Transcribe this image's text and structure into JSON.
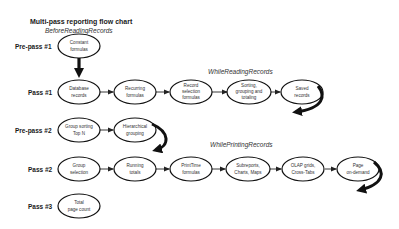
{
  "diagram": {
    "title": "Multi-pass reporting flow chart",
    "phases": [
      {
        "label": "BeforeReadingRecords"
      },
      {
        "label": "WhileReadingRecords"
      },
      {
        "label": "WhilePrintingRecords"
      }
    ],
    "rows": [
      {
        "label": "Pre-pass #1",
        "nodes": [
          {
            "lines": [
              "Constant",
              "formulas"
            ]
          }
        ]
      },
      {
        "label": "Pass #1",
        "nodes": [
          {
            "lines": [
              "Database",
              "records"
            ]
          },
          {
            "lines": [
              "Recurring",
              "formulas"
            ]
          },
          {
            "lines": [
              "Record",
              "selection",
              "formulas"
            ]
          },
          {
            "lines": [
              "Sorting,",
              "grouping and",
              "totaling"
            ]
          },
          {
            "lines": [
              "Saved",
              "records"
            ]
          }
        ]
      },
      {
        "label": "Pre-pass #2",
        "nodes": [
          {
            "lines": [
              "Group sorting",
              "Top N"
            ]
          },
          {
            "lines": [
              "Hierarchical",
              "grouping"
            ]
          }
        ]
      },
      {
        "label": "Pass #2",
        "nodes": [
          {
            "lines": [
              "Group",
              "selection"
            ]
          },
          {
            "lines": [
              "Running",
              "totals"
            ]
          },
          {
            "lines": [
              "PrintTime",
              "formulas"
            ]
          },
          {
            "lines": [
              "Subreports,",
              "Charts, Maps"
            ]
          },
          {
            "lines": [
              "OLAP grids,",
              "Cross-Tabs"
            ]
          },
          {
            "lines": [
              "Page",
              "on-demand"
            ]
          }
        ]
      },
      {
        "label": "Pass #3",
        "nodes": [
          {
            "lines": [
              "Total",
              "page count"
            ]
          }
        ]
      }
    ]
  }
}
